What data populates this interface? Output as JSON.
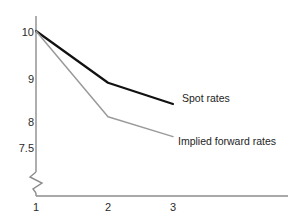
{
  "chart_data": {
    "type": "line",
    "title": "",
    "subtitle": "",
    "xlabel": "",
    "ylabel": "",
    "x": [
      1,
      2,
      3
    ],
    "x_tick_labels": [
      "1",
      "2",
      "3"
    ],
    "y_tick_labels": [
      "10",
      "9",
      "8",
      "7.5"
    ],
    "y_ticks": [
      10,
      9,
      8,
      7.5
    ],
    "ylim": [
      7.5,
      10
    ],
    "xlim": [
      1,
      3
    ],
    "grid": false,
    "axis_break": true,
    "axis_break_symbol": "zigzag",
    "legend_position": "inline-right-of-line-ends",
    "series": [
      {
        "name": "Spot rates",
        "values": [
          10.0,
          8.9,
          8.4
        ],
        "color": "#111111",
        "width": 2.2
      },
      {
        "name": "Implied forward rates",
        "values": [
          10.0,
          8.1,
          7.7
        ],
        "color": "#9a9a9a",
        "width": 1.5
      }
    ],
    "annotations": [
      {
        "text": "Spot rates",
        "x": 3,
        "y": 8.4
      },
      {
        "text": "Implied forward rates",
        "x": 3,
        "y": 7.7
      }
    ]
  },
  "axes": {
    "axis_color": "#8c8c8c",
    "y_labels": [
      {
        "text": "10",
        "top": 27,
        "right": 44
      },
      {
        "text": "9",
        "top": 74,
        "right": 44
      },
      {
        "text": "8",
        "top": 117,
        "right": 44
      },
      {
        "text": "7.5",
        "top": 143,
        "right": 44
      }
    ],
    "x_labels": [
      {
        "text": "1",
        "left": 36,
        "top": 201
      },
      {
        "text": "2",
        "left": 108,
        "top": 201
      },
      {
        "text": "3",
        "left": 173,
        "top": 201
      }
    ]
  },
  "labels": {
    "spot": {
      "text": "Spot rates",
      "left": 182,
      "top": 92
    },
    "forward": {
      "text": "Implied forward rates",
      "left": 178,
      "top": 135
    }
  }
}
